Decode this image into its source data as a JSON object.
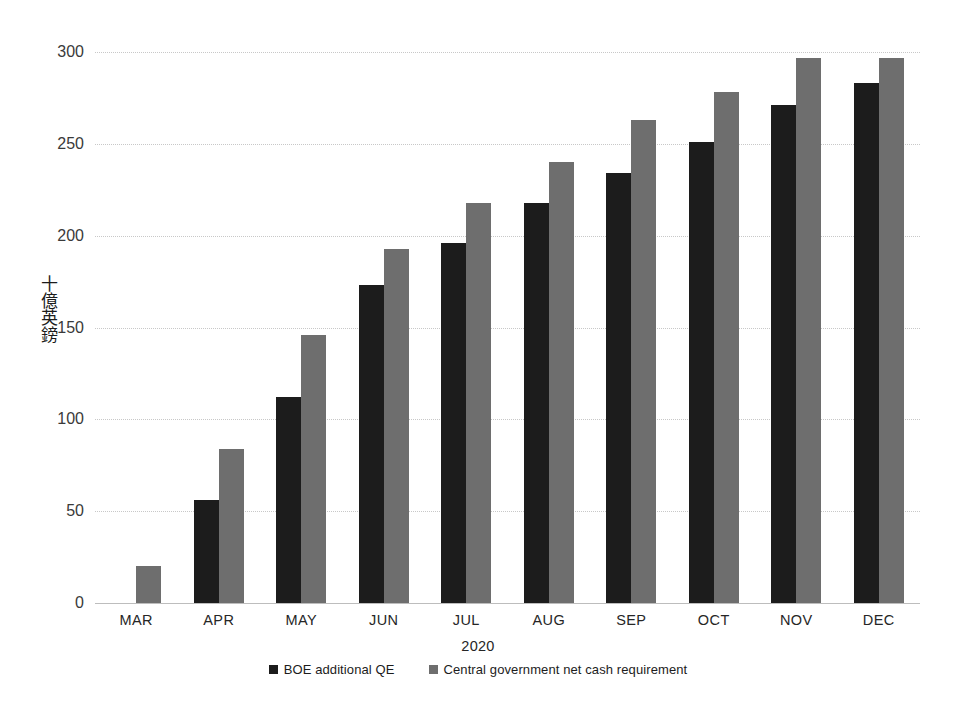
{
  "chart_data": {
    "type": "bar",
    "title": "",
    "subtitle": "",
    "xlabel": "2020",
    "ylabel": "十億英鎊",
    "ylim": [
      0,
      300
    ],
    "yticks": [
      0,
      50,
      100,
      150,
      200,
      250,
      300
    ],
    "grid": true,
    "legend_position": "bottom",
    "categories": [
      "MAR",
      "APR",
      "MAY",
      "JUN",
      "JUL",
      "AUG",
      "SEP",
      "OCT",
      "NOV",
      "DEC"
    ],
    "series": [
      {
        "name": "BOE additional QE",
        "color": "#1c1c1c",
        "values": [
          0,
          56,
          112,
          173,
          196,
          218,
          234,
          251,
          271,
          283
        ]
      },
      {
        "name": "Central government net cash requirement",
        "color": "#6e6e6e",
        "values": [
          20,
          84,
          146,
          193,
          218,
          240,
          263,
          278,
          297,
          297
        ]
      }
    ]
  },
  "axis": {
    "y_title": "十億英鎊",
    "x_title": "2020",
    "y_tick_labels": [
      "300",
      "250",
      "200",
      "150",
      "100",
      "50",
      "0"
    ],
    "x_tick_labels": [
      "MAR",
      "APR",
      "MAY",
      "JUN",
      "JUL",
      "AUG",
      "SEP",
      "OCT",
      "NOV",
      "DEC"
    ]
  },
  "legend": {
    "items": [
      {
        "label": "BOE additional QE",
        "color": "#1c1c1c",
        "swatch": "square-marker-icon"
      },
      {
        "label": "Central government net cash requirement",
        "color": "#6e6e6e",
        "swatch": "square-marker-icon"
      }
    ]
  },
  "colors": {
    "series_dark": "#1c1c1c",
    "series_gray": "#6e6e6e",
    "gridline": "#c8c8c8",
    "axis_text": "#3a3a3a",
    "background": "#ffffff"
  }
}
